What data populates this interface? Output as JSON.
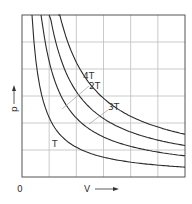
{
  "chart_data": {
    "type": "line",
    "title": "",
    "xlabel": "V",
    "ylabel": "p",
    "origin_label": "0",
    "xlim": [
      0,
      6
    ],
    "ylim": [
      0,
      6
    ],
    "grid": true,
    "grid_divisions": {
      "x": 6,
      "y": 6
    },
    "series": [
      {
        "name": "T",
        "relation": "p*V = 2",
        "label_pos": [
          1.15,
          1.2
        ]
      },
      {
        "name": "2T",
        "relation": "p*V = 4",
        "label_pos": [
          2.6,
          3.3
        ]
      },
      {
        "name": "3T",
        "relation": "p*V = 6",
        "label_pos": [
          3.45,
          2.5
        ]
      },
      {
        "name": "4T",
        "relation": "p*V = 8",
        "label_pos": [
          2.35,
          3.6
        ]
      }
    ],
    "annotations": [
      "isotherms of ideal gas p-V diagram",
      "two short construction lines connecting curves"
    ]
  },
  "labels": {
    "origin": "0",
    "x_axis": "V",
    "y_axis": "p",
    "T": "T",
    "T2": "2T",
    "T3": "3T",
    "T4": "4T"
  },
  "colors": {
    "line": "#2b2b2b",
    "grid": "#bdbdbd",
    "frame": "#555555"
  }
}
